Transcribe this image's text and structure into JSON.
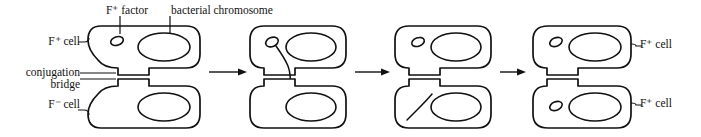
{
  "figure": {
    "background_color": "#ffffff",
    "line_color": "#111111"
  },
  "labels": {
    "f_factor": "F⁺ factor",
    "bacterial_chromosome": "bacterial chromosome",
    "fplus_cell_left": "F⁺ cell",
    "conjugation_bridge_line1": "conjugation",
    "conjugation_bridge_line2": "bridge",
    "fminus_cell_left": "F⁻ cell",
    "fplus_cell_top_right": "F⁺ cell",
    "fplus_cell_bottom_right": "F⁺ cell"
  },
  "stages": [
    {
      "id": "stage-1",
      "order": 1,
      "caption": "F+ cell joined to F- cell by conjugation bridge",
      "top_cell": {
        "type": "F+",
        "has_f_factor": true,
        "has_chromosome": true,
        "f_factor_state": "circular"
      },
      "bottom_cell": {
        "type": "F-",
        "has_f_factor": false,
        "has_chromosome": true,
        "f_factor_state": "none"
      }
    },
    {
      "id": "stage-2",
      "order": 2,
      "caption": "F factor unwinds and a single strand begins to move through the bridge",
      "top_cell": {
        "type": "F+",
        "has_f_factor": true,
        "has_chromosome": true,
        "f_factor_state": "unwinding"
      },
      "bottom_cell": {
        "type": "F-",
        "has_f_factor": false,
        "has_chromosome": true,
        "f_factor_state": "receiving"
      }
    },
    {
      "id": "stage-3",
      "order": 3,
      "caption": "Strand transfer completes; donor F factor recircularizes",
      "top_cell": {
        "type": "F+",
        "has_f_factor": true,
        "has_chromosome": true,
        "f_factor_state": "circular"
      },
      "bottom_cell": {
        "type": "F-",
        "has_f_factor": false,
        "has_chromosome": true,
        "f_factor_state": "linear-strand"
      }
    },
    {
      "id": "stage-4",
      "order": 4,
      "caption": "Both cells are now F+ cells",
      "top_cell": {
        "type": "F+",
        "has_f_factor": true,
        "has_chromosome": true,
        "f_factor_state": "circular"
      },
      "bottom_cell": {
        "type": "F+",
        "has_f_factor": true,
        "has_chromosome": true,
        "f_factor_state": "circular"
      }
    }
  ],
  "arrows": [
    {
      "id": "arrow-1",
      "from": "stage-1",
      "to": "stage-2",
      "direction": "right"
    },
    {
      "id": "arrow-2",
      "from": "stage-2",
      "to": "stage-3",
      "direction": "right"
    },
    {
      "id": "arrow-3",
      "from": "stage-3",
      "to": "stage-4",
      "direction": "right"
    }
  ]
}
